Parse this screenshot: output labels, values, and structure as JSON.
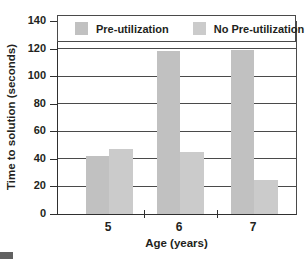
{
  "chart_data": {
    "type": "bar",
    "title": "",
    "xlabel": "Age (years)",
    "ylabel": "Time to solution (seconds)",
    "categories": [
      "5",
      "6",
      "7"
    ],
    "series": [
      {
        "name": "Pre-utilization",
        "values": [
          42,
          118,
          119
        ],
        "color": "#c1c1c1"
      },
      {
        "name": "No Pre-utilization",
        "values": [
          47,
          45,
          25
        ],
        "color": "#cbcbcb"
      }
    ],
    "ylim": [
      0,
      140
    ],
    "yticks": [
      0,
      20,
      40,
      60,
      80,
      100,
      120,
      140
    ],
    "grid": true,
    "legend_position": "top-inside"
  },
  "figure": {
    "background": "#ffffff",
    "axis_color": "#2f2f2f",
    "grid_color": "#4a4a4a",
    "text_color": "#231f20",
    "corner_marker_color": "#616161"
  }
}
